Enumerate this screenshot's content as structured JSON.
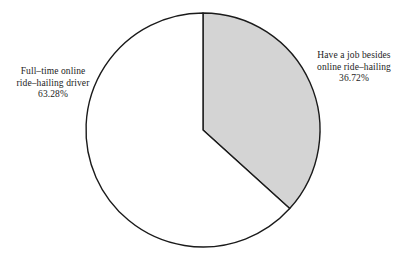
{
  "chart_data": {
    "type": "pie",
    "title": "",
    "subtitle": "",
    "xlabel": "",
    "ylabel": "",
    "legend_position": "none",
    "grid": false,
    "start_angle_deg": 90,
    "direction": "clockwise",
    "categories": [
      "Have a job besides online ride–hailing",
      "Full–time online ride–hailing driver"
    ],
    "values": [
      36.72,
      63.28
    ],
    "value_unit": "%",
    "slices": [
      {
        "name": "Have a job besides online ride–hailing",
        "value": 36.72,
        "value_label": "36.72%",
        "fill": "#d4d4d4",
        "stroke": "#1a1a1a",
        "label_lines": [
          "Have a job besides",
          "online ride–hailing"
        ]
      },
      {
        "name": "Full–time online ride–hailing driver",
        "value": 63.28,
        "value_label": "63.28%",
        "fill": "#ffffff",
        "stroke": "#1a1a1a",
        "label_lines": [
          "Full–time online",
          "ride–hailing driver"
        ]
      }
    ]
  },
  "labels": {
    "left": {
      "line1": "Full–time online",
      "line2": "ride–hailing driver",
      "value": "63.28%"
    },
    "right": {
      "line1": "Have a job besides",
      "line2": "online ride–hailing",
      "value": "36.72%"
    }
  },
  "colors": {
    "shaded_slice": "#d4d4d4",
    "plain_slice": "#ffffff",
    "outline": "#1a1a1a",
    "background": "#ffffff",
    "text": "#1c1c1c"
  },
  "geometry": {
    "center_x": 203,
    "center_y": 130,
    "radius": 117
  }
}
